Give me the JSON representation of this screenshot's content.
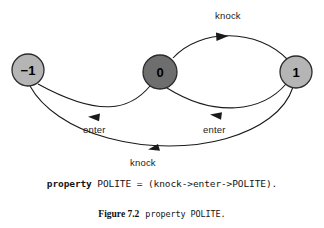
{
  "figure": {
    "nodes": [
      {
        "id": "minus-one",
        "label": "−1",
        "cx": 28,
        "cy": 70,
        "r": 16,
        "fill": "#b5b5b5",
        "stroke": "#2b2b2b",
        "text_color": "#000000"
      },
      {
        "id": "zero",
        "label": "0",
        "cx": 160,
        "cy": 72,
        "r": 17,
        "fill": "#6e6e6e",
        "stroke": "#2b2b2b",
        "text_color": "#000000"
      },
      {
        "id": "one",
        "label": "1",
        "cx": 296,
        "cy": 72,
        "r": 16,
        "fill": "#b5b5b5",
        "stroke": "#2b2b2b",
        "text_color": "#000000"
      }
    ],
    "edges": [
      {
        "id": "edge-knock-top",
        "label": "knock",
        "from": "zero",
        "to": "one",
        "label_x": 231,
        "label_y": 12,
        "arrow_dir": "right"
      },
      {
        "id": "edge-enter-left",
        "label": "enter",
        "from": "zero",
        "to": "minus-one",
        "label_x": 96,
        "label_y": 127,
        "arrow_dir": "left"
      },
      {
        "id": "edge-enter-right",
        "label": "enter",
        "from": "one",
        "to": "zero",
        "label_x": 216,
        "label_y": 127,
        "arrow_dir": "left"
      },
      {
        "id": "edge-knock-bottom",
        "label": "knock",
        "from": "one",
        "to": "minus-one",
        "label_x": 145,
        "label_y": 160,
        "arrow_dir": "left"
      }
    ],
    "stroke_color": "#1a1a1a"
  },
  "code": {
    "keyword": "property",
    "rest": " POLITE = (knock->enter->POLITE)."
  },
  "caption": {
    "number": "Figure 7.2",
    "text": "property POLITE."
  }
}
